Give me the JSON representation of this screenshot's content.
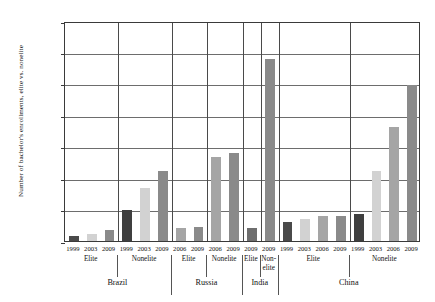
{
  "chart_data": {
    "type": "bar",
    "title": "",
    "xlabel": "",
    "ylabel": "Number of bachelor's enrollments, elite vs. nonelite",
    "ylim": [
      0,
      14000000
    ],
    "ytick_step": 2000000,
    "ytick_labels": [
      "14,000,000",
      "12,000,000",
      "10,000,000",
      "8,000,000",
      "6,000,000",
      "4,000,000",
      "2,000,000",
      "0"
    ],
    "ytick_values": [
      14000000,
      12000000,
      10000000,
      8000000,
      6000000,
      4000000,
      2000000,
      0
    ],
    "grid": true,
    "legend": "none",
    "orientation": "vertical",
    "bar_colors_by_year": {
      "1999": "#4a4a4a",
      "2003": "#d2d2d2",
      "2006": "#a5a5a5",
      "2009": "#8a8a8a"
    },
    "countries": [
      {
        "name": "Brazil",
        "tiers": [
          {
            "label": "Elite",
            "bars": [
              {
                "year": "1999",
                "value": 330000,
                "color": "#4a4a4a"
              },
              {
                "year": "2003",
                "value": 440000,
                "color": "#d2d2d2"
              },
              {
                "year": "2009",
                "value": 680000,
                "color": "#8a8a8a"
              }
            ]
          },
          {
            "label": "Nonelite",
            "bars": [
              {
                "year": "1999",
                "value": 2000000,
                "color": "#3f3f3f"
              },
              {
                "year": "2003",
                "value": 3370000,
                "color": "#d2d2d2"
              },
              {
                "year": "2009",
                "value": 4430000,
                "color": "#8a8a8a"
              }
            ]
          }
        ]
      },
      {
        "name": "Russia",
        "tiers": [
          {
            "label": "Elite",
            "bars": [
              {
                "year": "2006",
                "value": 820000,
                "color": "#a5a5a5"
              },
              {
                "year": "2009",
                "value": 870000,
                "color": "#8a8a8a"
              }
            ]
          },
          {
            "label": "Nonelite",
            "bars": [
              {
                "year": "2006",
                "value": 5350000,
                "color": "#a5a5a5"
              },
              {
                "year": "2009",
                "value": 5600000,
                "color": "#8a8a8a"
              }
            ]
          }
        ]
      },
      {
        "name": "India",
        "tiers": [
          {
            "label": "Elite",
            "bars": [
              {
                "year": "2009",
                "value": 860000,
                "color": "#6e6e6e"
              }
            ]
          },
          {
            "label": "Non-elite",
            "bars": [
              {
                "year": "2009",
                "value": 11600000,
                "color": "#8a8a8a"
              }
            ]
          }
        ]
      },
      {
        "name": "China",
        "tiers": [
          {
            "label": "Elite",
            "bars": [
              {
                "year": "1999",
                "value": 1180000,
                "color": "#4a4a4a"
              },
              {
                "year": "2003",
                "value": 1400000,
                "color": "#d2d2d2"
              },
              {
                "year": "2006",
                "value": 1570000,
                "color": "#a5a5a5"
              },
              {
                "year": "2009",
                "value": 1620000,
                "color": "#8a8a8a"
              }
            ]
          },
          {
            "label": "Nonelite",
            "bars": [
              {
                "year": "1999",
                "value": 1700000,
                "color": "#3f3f3f"
              },
              {
                "year": "2003",
                "value": 4480000,
                "color": "#d2d2d2"
              },
              {
                "year": "2006",
                "value": 7250000,
                "color": "#a5a5a5"
              },
              {
                "year": "2009",
                "value": 9950000,
                "color": "#8a8a8a"
              }
            ]
          }
        ]
      }
    ]
  }
}
